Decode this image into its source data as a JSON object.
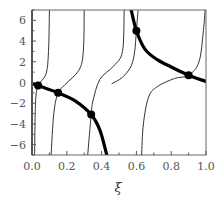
{
  "chart_data": {
    "type": "line",
    "title": "",
    "xlabel": "ξ",
    "ylabel": "",
    "xlim": [
      0.0,
      1.0
    ],
    "ylim": [
      -7,
      7
    ],
    "grid": false,
    "legend": null,
    "x_ticks": [
      "0.0",
      "0.2",
      "0.4",
      "0.6",
      "0.8",
      "1.0"
    ],
    "y_ticks": [
      "6",
      "4",
      "2",
      "0",
      "-2",
      "-4",
      "-6"
    ],
    "colors": {
      "frame": "#666666",
      "thin": "#333333",
      "thick": "#000000"
    },
    "series": [
      {
        "name": "thick-branch-1",
        "style": "thick",
        "points": [
          [
            0.0,
            -0.1
          ],
          [
            0.035,
            -0.3
          ],
          [
            0.15,
            -1.0
          ],
          [
            0.25,
            -1.8
          ],
          [
            0.34,
            -3.1
          ],
          [
            0.39,
            -4.6
          ],
          [
            0.43,
            -7.0
          ]
        ]
      },
      {
        "name": "thick-branch-2",
        "style": "thick",
        "points": [
          [
            0.57,
            7.0
          ],
          [
            0.6,
            5.0
          ],
          [
            0.65,
            3.2
          ],
          [
            0.72,
            2.2
          ],
          [
            0.8,
            1.5
          ],
          [
            0.9,
            0.7
          ],
          [
            1.0,
            0.1
          ]
        ]
      },
      {
        "name": "thin-branch-a",
        "style": "thin",
        "points": [
          [
            0.1,
            7.0
          ],
          [
            0.095,
            3.0
          ],
          [
            0.08,
            0.8
          ],
          [
            0.035,
            -0.3
          ],
          [
            0.02,
            -2.0
          ],
          [
            0.015,
            -7.0
          ]
        ]
      },
      {
        "name": "thin-branch-b",
        "style": "thin",
        "points": [
          [
            0.3,
            7.0
          ],
          [
            0.295,
            3.0
          ],
          [
            0.27,
            1.2
          ],
          [
            0.19,
            -0.2
          ],
          [
            0.15,
            -1.0
          ],
          [
            0.125,
            -3.0
          ],
          [
            0.11,
            -7.0
          ]
        ]
      },
      {
        "name": "thin-branch-c",
        "style": "thin",
        "points": [
          [
            0.53,
            7.0
          ],
          [
            0.52,
            3.0
          ],
          [
            0.47,
            1.6
          ],
          [
            0.39,
            0.3
          ],
          [
            0.35,
            -1.8
          ],
          [
            0.34,
            -3.1
          ],
          [
            0.32,
            -7.0
          ]
        ]
      },
      {
        "name": "thin-branch-d",
        "style": "thin",
        "points": [
          [
            0.46,
            -0.1
          ],
          [
            0.52,
            0.5
          ],
          [
            0.57,
            1.6
          ],
          [
            0.59,
            3.0
          ],
          [
            0.6,
            5.0
          ],
          [
            0.61,
            7.0
          ]
        ]
      },
      {
        "name": "thin-branch-e",
        "style": "thin",
        "points": [
          [
            0.63,
            -7.0
          ],
          [
            0.64,
            -4.0
          ],
          [
            0.67,
            -1.4
          ],
          [
            0.72,
            -0.4
          ],
          [
            0.82,
            0.4
          ],
          [
            0.9,
            0.7
          ],
          [
            0.96,
            2.0
          ],
          [
            0.985,
            5.0
          ],
          [
            0.995,
            7.0
          ]
        ]
      }
    ],
    "markers": [
      {
        "x": 0.035,
        "y": -0.3
      },
      {
        "x": 0.15,
        "y": -1.0
      },
      {
        "x": 0.34,
        "y": -3.1
      },
      {
        "x": 0.6,
        "y": 5.0
      },
      {
        "x": 0.9,
        "y": 0.7
      }
    ]
  }
}
